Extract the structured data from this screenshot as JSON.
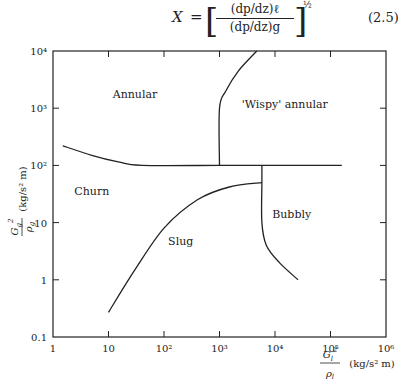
{
  "equation": {
    "lhs": "X",
    "equals": "=",
    "numerator": "(dp/dz)ℓ",
    "denominator": "(dp/dz)g",
    "exponent": "½",
    "number": "(2.5)"
  },
  "chart_data": {
    "type": "line",
    "title": "",
    "xlabel": "G_l^2/ρ_l (kg/s² m)",
    "ylabel": "G_g^2/ρ_g (kg/s² m)",
    "xscale": "log",
    "yscale": "log",
    "xlim": [
      1,
      1000000
    ],
    "ylim": [
      0.1,
      10000
    ],
    "grid": false,
    "x_ticks": [
      "1",
      "10",
      "10²",
      "10³",
      "10⁴",
      "10⁵",
      "10⁶"
    ],
    "y_ticks": [
      "0.1",
      "1",
      "10",
      "10²",
      "10³",
      "10⁴"
    ],
    "regions": [
      {
        "name": "Annular",
        "x": 30,
        "y": 1500
      },
      {
        "name": "'Wispy' annular",
        "x": 15000,
        "y": 1000
      },
      {
        "name": "Churn",
        "x": 5,
        "y": 30
      },
      {
        "name": "Slug",
        "x": 200,
        "y": 4
      },
      {
        "name": "Bubbly",
        "x": 20000,
        "y": 12
      }
    ],
    "series": [
      {
        "name": "annular-churn boundary",
        "points": [
          [
            1.5,
            220
          ],
          [
            5,
            150
          ],
          [
            15,
            115
          ],
          [
            40,
            100
          ],
          [
            1000,
            100
          ],
          [
            6000,
            100
          ],
          [
            160000,
            100
          ]
        ]
      },
      {
        "name": "annular-wispy boundary",
        "points": [
          [
            1000,
            100
          ],
          [
            1000,
            1000
          ],
          [
            1300,
            2000
          ],
          [
            2200,
            4500
          ],
          [
            4700,
            10000
          ]
        ]
      },
      {
        "name": "churn-slug boundary",
        "points": [
          [
            10,
            0.27
          ],
          [
            30,
            1.5
          ],
          [
            100,
            8
          ],
          [
            400,
            25
          ],
          [
            1500,
            42
          ],
          [
            5800,
            50
          ]
        ]
      },
      {
        "name": "slug-bubbly boundary",
        "points": [
          [
            5800,
            100
          ],
          [
            5800,
            50
          ],
          [
            5800,
            10
          ],
          [
            7000,
            4
          ],
          [
            12000,
            2
          ],
          [
            26000,
            1
          ]
        ]
      }
    ]
  },
  "labels": {
    "x_axis_label_num": "G",
    "x_axis_label_sub": "l",
    "x_axis_label_den": "ρ",
    "x_axis_units": "(kg/s² m)",
    "y_axis_label": "(kg/s² m)"
  }
}
